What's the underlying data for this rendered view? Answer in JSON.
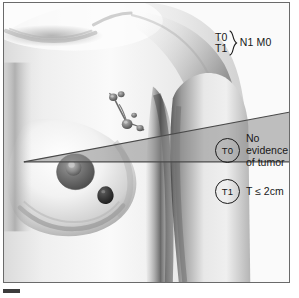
{
  "figure": {
    "name": "breast-cancer-tnm-staging-illustration",
    "frame_border_color": "#6a6a6a",
    "background_color": "#fbfbfb"
  },
  "stage_header": {
    "row_one": "T0",
    "row_two": "T1",
    "brace": "}",
    "node_metastasis": "N1 M0"
  },
  "callouts": [
    {
      "id": "t0",
      "marker": "T0",
      "lines": [
        "No",
        "evidence",
        "of tumor"
      ]
    },
    {
      "id": "t1",
      "marker": "T1",
      "lines": [
        "T ≤ 2cm"
      ]
    }
  ],
  "wedge": {
    "fill_color": "#8d8d8d",
    "opacity": 0.55,
    "line_color": "#4a4a4a",
    "apex_x": 20,
    "apex_y": 160,
    "right_top_x": 287,
    "right_top_y": 110,
    "baseline_y": 160
  },
  "anatomy_features": [
    {
      "name": "clavicle-shading"
    },
    {
      "name": "shoulder-deltoid"
    },
    {
      "name": "upper-arm"
    },
    {
      "name": "breast"
    },
    {
      "name": "nipple-areola"
    },
    {
      "name": "tumor-lesion"
    },
    {
      "name": "axillary-lymph-node-chain"
    },
    {
      "name": "sternum-midline"
    }
  ],
  "corner_tick": {
    "color": "#3c3c3c"
  }
}
